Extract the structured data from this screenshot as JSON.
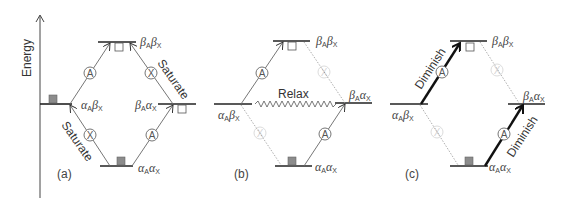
{
  "axis": {
    "label": "Energy"
  },
  "states": {
    "bb": {
      "a": "β",
      "a_sub": "A",
      "b": "β",
      "b_sub": "X"
    },
    "ab": {
      "a": "α",
      "a_sub": "A",
      "b": "β",
      "b_sub": "X"
    },
    "ba": {
      "a": "β",
      "a_sub": "A",
      "b": "α",
      "b_sub": "X"
    },
    "aa": {
      "a": "α",
      "a_sub": "A",
      "b": "α",
      "b_sub": "X"
    }
  },
  "transition_labels": {
    "A": "A",
    "X": "X"
  },
  "panels": [
    {
      "id": "a",
      "label": "(a)",
      "annotations": [
        "Saturate",
        "Saturate"
      ]
    },
    {
      "id": "b",
      "label": "(b)",
      "annotations": [
        "Relax"
      ]
    },
    {
      "id": "c",
      "label": "(c)",
      "annotations": [
        "Diminish",
        "Diminish"
      ]
    }
  ],
  "colors": {
    "line": "#222222",
    "thin": "#666666",
    "faint": "#bbbbbb",
    "filled_square": "#8c8c8c",
    "open_square": "#ffffff"
  }
}
